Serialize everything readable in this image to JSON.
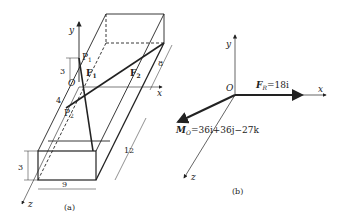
{
  "figure_a": {
    "caption": "(a)",
    "axes": {
      "x": "x",
      "y": "y",
      "z": "z"
    },
    "origin": "O",
    "points": {
      "p1": "P",
      "p1_sub": "1",
      "p2": "P",
      "p2_sub": "2"
    },
    "forces": {
      "f1": "F",
      "f1_sub": "1",
      "f2": "F",
      "f2_sub": "2"
    },
    "dimensions": {
      "height_upper": "3",
      "offset": "4",
      "height_lower": "3",
      "width": "9",
      "length": "12",
      "depth": "8"
    }
  },
  "figure_b": {
    "caption": "(b)",
    "axes": {
      "x": "x",
      "y": "y",
      "z": "z"
    },
    "origin": "O",
    "resultant_force": {
      "symbol": "F",
      "sub": "R",
      "expr": "=18i"
    },
    "moment": {
      "symbol": "M",
      "sub": "O",
      "expr": "=36i+36j−27k"
    }
  }
}
